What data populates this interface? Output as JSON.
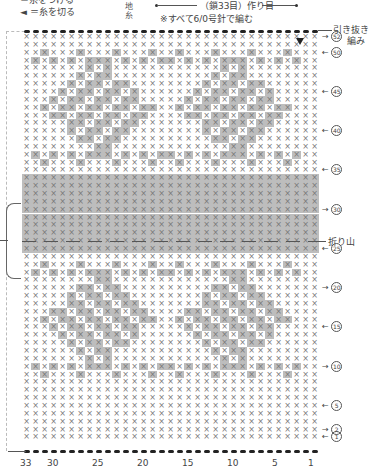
{
  "legend": {
    "top_line": "＝糸をつける",
    "cut_symbol": "◄",
    "cut_label": "＝糸を切る"
  },
  "ground_label": [
    "地",
    "糸"
  ],
  "header": {
    "cast_on": "（鎖33目）作り目",
    "note": "※すべて6/0号針で編む"
  },
  "right_labels": {
    "pull_through": "引き抜き",
    "knit": "編み",
    "fold": "折り山"
  },
  "rows": {
    "total": 52,
    "marked": [
      {
        "n": 52,
        "label": "52",
        "dir": "right"
      },
      {
        "n": 50,
        "label": "50",
        "dir": "left"
      },
      {
        "n": 45,
        "label": "45",
        "dir": "left"
      },
      {
        "n": 40,
        "label": "40",
        "dir": "left"
      },
      {
        "n": 35,
        "label": "35",
        "dir": "left"
      },
      {
        "n": 30,
        "label": "30",
        "dir": "right"
      },
      {
        "n": 25,
        "label": "25",
        "dir": "left"
      },
      {
        "n": 20,
        "label": "20",
        "dir": "right"
      },
      {
        "n": 15,
        "label": "15",
        "dir": "left"
      },
      {
        "n": 10,
        "label": "10",
        "dir": "right"
      },
      {
        "n": 5,
        "label": "5",
        "dir": "left"
      },
      {
        "n": 2,
        "label": "2",
        "dir": "right"
      },
      {
        "n": 1,
        "label": "1",
        "dir": "left"
      }
    ]
  },
  "columns": {
    "total": 33,
    "labels": [
      "33",
      "30",
      "25",
      "20",
      "15",
      "10",
      "5",
      "1"
    ],
    "label_cols": [
      33,
      30,
      25,
      20,
      15,
      10,
      5,
      1
    ]
  },
  "colors": {
    "shade": "#bdbdbd",
    "dark": "#a9a9a9",
    "stitch": "#777777",
    "line": "#444444"
  },
  "chart_data": {
    "type": "heatmap",
    "title": "（鎖33目）作り目",
    "subtitle": "※すべて6/0号針で編む",
    "xlabel": "stitch",
    "ylabel": "row",
    "x_ticks": [
      33,
      30,
      25,
      20,
      15,
      10,
      5,
      1
    ],
    "y_ticks": [
      1,
      2,
      5,
      10,
      15,
      20,
      25,
      30,
      35,
      40,
      45,
      50,
      52
    ],
    "solid_band_rows": [
      25,
      34
    ],
    "fold_row": 30,
    "motif": "leaf pattern, mirrored above and below fold line",
    "stitch_symbol": "×",
    "grid": [
      33,
      52
    ]
  }
}
